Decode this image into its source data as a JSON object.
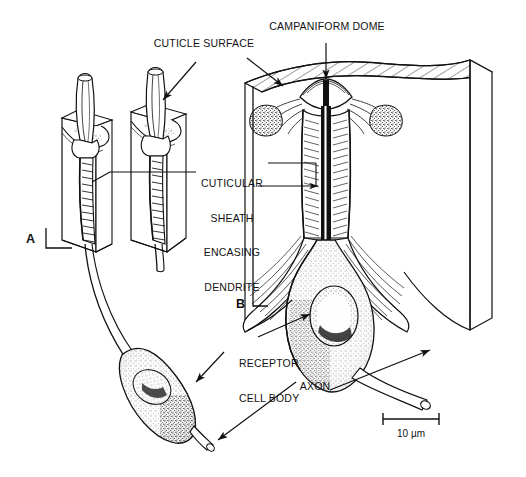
{
  "figure": {
    "background_color": "#ffffff",
    "ink_color": "#111111"
  },
  "labels": {
    "cuticle_surface": "CUTICLE SURFACE",
    "campaniform_dome": "CAMPANIFORM DOME",
    "cuticular_sheath": "CUTICULAR\nSHEATH\nENCASING\nDENDRITE",
    "cuticular_sheath_lines": [
      "CUTICULAR",
      "SHEATH",
      "ENCASING",
      "DENDRITE"
    ],
    "receptor_cell_body": "RECEPTOR\nCELL BODY",
    "receptor_cell_body_lines": [
      "RECEPTOR",
      "CELL BODY"
    ],
    "axon": "AXON"
  },
  "panels": {
    "a_letter": "A",
    "b_letter": "B"
  },
  "scale_bar": {
    "caption": "10 µm",
    "length_px": 56
  }
}
